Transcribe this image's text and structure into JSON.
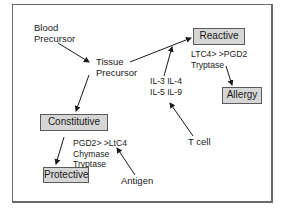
{
  "diagram": {
    "nodes": {
      "blood_precursor": [
        "Blood",
        "Precursor"
      ],
      "tissue_precursor": [
        "Tissue",
        "Precursor"
      ],
      "reactive": "Reactive",
      "reactive_mediators": [
        "LTC4> >PGD2",
        "Tryptase"
      ],
      "allergy": "Allergy",
      "cytokines": [
        "IL-3 IL-4",
        "IL-5 IL-9"
      ],
      "t_cell": "T cell",
      "constitutive": "Constitutive",
      "constitutive_mediators": [
        "PGD2> >LtC4",
        "Chymase",
        "Tryptase"
      ],
      "protective": "Protective",
      "antigen": "Antigen"
    },
    "edges": [
      {
        "from": "Blood Precursor",
        "to": "Tissue Precursor"
      },
      {
        "from": "Tissue Precursor",
        "to": "Reactive"
      },
      {
        "from": "Tissue Precursor",
        "to": "Constitutive"
      },
      {
        "from": "Reactive",
        "to": "Allergy"
      },
      {
        "from": "IL-3 IL-4 IL-5 IL-9",
        "to": "Tissue Precursor → Reactive edge"
      },
      {
        "from": "T cell",
        "to": "IL-3 IL-4 IL-5 IL-9"
      },
      {
        "from": "Constitutive",
        "to": "Protective"
      },
      {
        "from": "Antigen",
        "to": "PGD2> >LtC4"
      }
    ],
    "colors": {
      "box_fill": "#d6d6d6",
      "box_border": "#5a5a5a",
      "frame": "#6a6a6a",
      "line": "#1a1a1a"
    }
  }
}
